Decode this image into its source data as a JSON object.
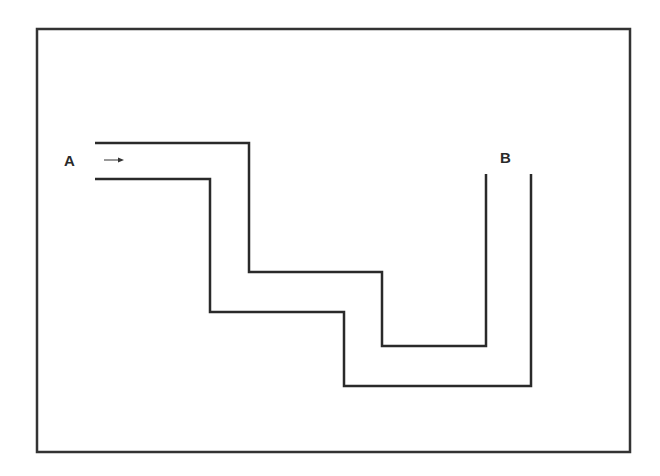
{
  "diagram": {
    "type": "pipe-path",
    "frame": {
      "x": 37,
      "y": 29,
      "width": 593,
      "height": 423,
      "stroke": "#333333"
    },
    "labels": {
      "start": "A",
      "end": "B"
    },
    "flow_direction": "right",
    "stroke_color": "#2a2a2a",
    "outer_wall": [
      [
        95,
        143
      ],
      [
        249,
        143
      ],
      [
        249,
        272
      ],
      [
        382,
        272
      ],
      [
        382,
        346
      ],
      [
        486,
        346
      ],
      [
        486,
        174
      ]
    ],
    "inner_wall": [
      [
        95,
        179
      ],
      [
        210,
        179
      ],
      [
        210,
        312
      ],
      [
        344,
        312
      ],
      [
        344,
        386
      ],
      [
        531,
        386
      ],
      [
        531,
        174
      ]
    ],
    "arrow": {
      "x1": 104,
      "y1": 160,
      "x2": 124,
      "y2": 160
    }
  }
}
